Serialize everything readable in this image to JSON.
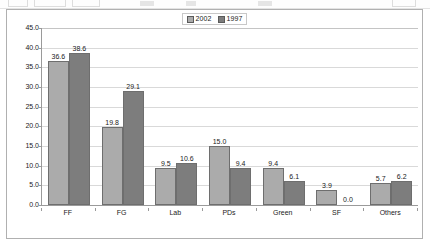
{
  "window": {
    "toolbar_visible_fragment": true
  },
  "chart": {
    "legend_position": "top-center",
    "series_colors": {
      "2002": "#ababab",
      "1997": "#7d7d7d"
    }
  },
  "chart_data": {
    "type": "bar",
    "title": "",
    "subtitle": "",
    "xlabel": "",
    "ylabel": "",
    "ylim": [
      0.0,
      45.0
    ],
    "ytick_step": 5.0,
    "grid": true,
    "legend": [
      "2002",
      "1997"
    ],
    "legend_position": "top-center",
    "categories": [
      "FF",
      "FG",
      "Lab",
      "PDs",
      "Green",
      "SF",
      "Others"
    ],
    "ytick_labels": [
      "45.0",
      "40.0",
      "35.0",
      "30.0",
      "25.0",
      "20.0",
      "15.0",
      "10.0",
      "5.0",
      "0.0"
    ],
    "series": [
      {
        "name": "2002",
        "color": "#ababab",
        "values": [
          36.6,
          19.8,
          9.5,
          15.0,
          9.4,
          3.9,
          5.7
        ],
        "labels": [
          "36.6",
          "19.8",
          "9.5",
          "15.0",
          "9.4",
          "3.9",
          "5.7"
        ]
      },
      {
        "name": "1997",
        "color": "#7d7d7d",
        "values": [
          38.6,
          29.1,
          10.6,
          9.4,
          6.1,
          0.0,
          6.2
        ],
        "labels": [
          "38.6",
          "29.1",
          "10.6",
          "9.4",
          "6.1",
          "0.0",
          "6.2"
        ]
      }
    ]
  }
}
